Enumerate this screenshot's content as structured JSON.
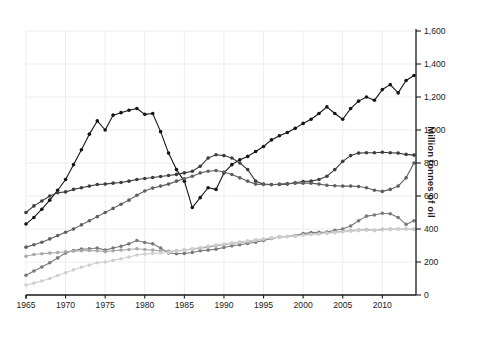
{
  "chart_data": {
    "type": "line",
    "title": "",
    "subtitle": "",
    "xlabel": "",
    "ylabel": "Million tonnes of oil",
    "xlim": [
      1965,
      2014
    ],
    "ylim": [
      0,
      1600
    ],
    "ytick_step": 200,
    "xtick_step": 5,
    "grid": true,
    "grid_color": "#e8e8ea",
    "legend": "none",
    "y_axis_position": "right",
    "background": "#ffffff",
    "x": [
      1965,
      1966,
      1967,
      1968,
      1969,
      1970,
      1971,
      1972,
      1973,
      1974,
      1975,
      1976,
      1977,
      1978,
      1979,
      1980,
      1981,
      1982,
      1983,
      1984,
      1985,
      1986,
      1987,
      1988,
      1989,
      1990,
      1991,
      1992,
      1993,
      1994,
      1995,
      1996,
      1997,
      1998,
      1999,
      2000,
      2001,
      2002,
      2003,
      2004,
      2005,
      2006,
      2007,
      2008,
      2009,
      2010,
      2011,
      2012,
      2013,
      2014
    ],
    "xticklabels": [
      "1965",
      "1970",
      "1975",
      "1980",
      "1985",
      "1990",
      "1995",
      "2000",
      "2005",
      "2010"
    ],
    "yticklabels": [
      "0",
      "200",
      "400",
      "600",
      "800",
      "1,000",
      "1,200",
      "1,400",
      "1,600"
    ],
    "series": [
      {
        "name": "series-1-black",
        "color": "#151515",
        "values": [
          430,
          470,
          520,
          575,
          635,
          700,
          790,
          880,
          975,
          1055,
          1000,
          1090,
          1105,
          1120,
          1130,
          1095,
          1100,
          990,
          860,
          760,
          690,
          530,
          590,
          650,
          640,
          740,
          790,
          820,
          840,
          870,
          900,
          940,
          965,
          985,
          1010,
          1040,
          1065,
          1100,
          1140,
          1100,
          1065,
          1130,
          1175,
          1200,
          1180,
          1245,
          1275,
          1225,
          1300,
          1330
        ]
      },
      {
        "name": "series-2-darkgray",
        "color": "#3d3d3d",
        "values": [
          500,
          540,
          570,
          600,
          620,
          625,
          640,
          650,
          660,
          670,
          672,
          678,
          682,
          690,
          700,
          706,
          712,
          718,
          724,
          731,
          740,
          750,
          780,
          830,
          850,
          845,
          830,
          800,
          760,
          690,
          672,
          670,
          670,
          672,
          680,
          688,
          690,
          700,
          720,
          760,
          810,
          845,
          860,
          862,
          862,
          865,
          862,
          860,
          852,
          848
        ]
      },
      {
        "name": "series-3-gray",
        "color": "#5f5f5f",
        "values": [
          290,
          305,
          320,
          340,
          360,
          380,
          400,
          425,
          450,
          475,
          500,
          525,
          550,
          575,
          605,
          630,
          648,
          660,
          672,
          690,
          705,
          720,
          740,
          750,
          755,
          745,
          730,
          710,
          690,
          672,
          670,
          668,
          672,
          676,
          678,
          678,
          678,
          672,
          665,
          662,
          660,
          660,
          658,
          650,
          635,
          628,
          640,
          660,
          710,
          800
        ]
      },
      {
        "name": "series-4-midgray",
        "color": "#7a7a7a",
        "values": [
          120,
          145,
          170,
          195,
          225,
          255,
          270,
          278,
          280,
          285,
          272,
          285,
          295,
          310,
          330,
          318,
          310,
          285,
          255,
          250,
          252,
          258,
          268,
          272,
          278,
          288,
          298,
          305,
          312,
          320,
          330,
          342,
          352,
          355,
          360,
          372,
          378,
          380,
          382,
          392,
          400,
          418,
          450,
          478,
          485,
          495,
          492,
          470,
          428,
          450
        ]
      },
      {
        "name": "series-5-lightgray",
        "color": "#a8a8a8",
        "values": [
          235,
          245,
          250,
          254,
          258,
          262,
          266,
          268,
          270,
          268,
          262,
          268,
          272,
          276,
          280,
          276,
          272,
          268,
          266,
          268,
          272,
          278,
          284,
          290,
          298,
          305,
          312,
          318,
          322,
          330,
          338,
          345,
          352,
          355,
          358,
          365,
          368,
          372,
          376,
          380,
          386,
          390,
          394,
          396,
          392,
          398,
          400,
          400,
          400,
          398
        ]
      },
      {
        "name": "series-6-palegray",
        "color": "#cfcfcf",
        "values": [
          60,
          72,
          85,
          100,
          118,
          135,
          152,
          168,
          182,
          195,
          200,
          210,
          220,
          230,
          242,
          248,
          252,
          255,
          258,
          265,
          272,
          280,
          288,
          296,
          304,
          310,
          316,
          322,
          328,
          334,
          340,
          346,
          352,
          354,
          358,
          362,
          366,
          370,
          374,
          378,
          382,
          386,
          390,
          392,
          390,
          394,
          396,
          398,
          398,
          400
        ]
      }
    ]
  },
  "plot": {
    "marker_radius": 1.8,
    "line_width": 1.1,
    "axis_color": "#1a1a1a"
  }
}
